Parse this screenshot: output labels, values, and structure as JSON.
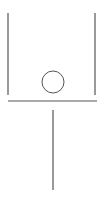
{
  "diagram": {
    "stroke_color": "#555555",
    "background": "#ffffff",
    "elements": {
      "left_wall": {
        "x1": 8,
        "y1": 13,
        "x2": 8,
        "y2": 95
      },
      "right_wall": {
        "x1": 95,
        "y1": 13,
        "x2": 95,
        "y2": 95
      },
      "base_line": {
        "x1": 8,
        "y1": 101,
        "x2": 97,
        "y2": 101
      },
      "circle": {
        "cx": 53,
        "cy": 82,
        "r": 11
      },
      "stem": {
        "x1": 53,
        "y1": 110,
        "x2": 53,
        "y2": 190
      }
    }
  }
}
